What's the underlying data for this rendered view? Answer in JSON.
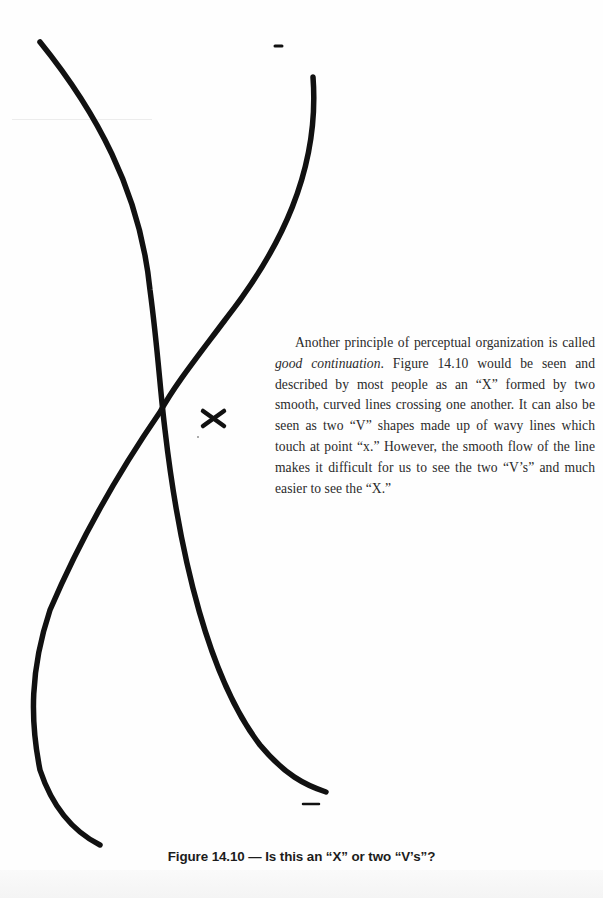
{
  "figure": {
    "number": "Figure 14.10",
    "caption": "Figure 14.10 — Is this an “X” or two “V’s”?",
    "marker_label": "x",
    "stroke_color": "#111111"
  },
  "body": {
    "paragraph_lead": "Another principle of perceptual organization is called ",
    "term": "good continuation",
    "paragraph_rest": ". Figure 14.10 would be seen and described by most people as an “X” formed by two smooth, curved lines crossing one another. It can also be seen as two “V” shapes made up of wavy lines which touch at point “x.” However, the smooth flow of the line makes it difficult for us to see the two “V’s” and much easier to see the “X.”"
  }
}
